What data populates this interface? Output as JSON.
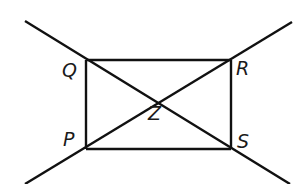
{
  "diagram": {
    "type": "geometry",
    "stroke_color": "#111111",
    "background": "#ffffff",
    "points": {
      "Q": {
        "label": "Q",
        "x": 86,
        "y": 60
      },
      "R": {
        "label": "R",
        "x": 231,
        "y": 60
      },
      "P": {
        "label": "P",
        "x": 86,
        "y": 149
      },
      "S": {
        "label": "S",
        "x": 231,
        "y": 149
      },
      "Z": {
        "label": "Z",
        "x": 158.5,
        "y": 104.5
      }
    },
    "segments": [
      {
        "name": "QR",
        "from": "Q",
        "to": "R"
      },
      {
        "name": "RS",
        "from": "R",
        "to": "S"
      },
      {
        "name": "SP",
        "from": "S",
        "to": "P"
      },
      {
        "name": "PQ",
        "from": "P",
        "to": "Q"
      }
    ],
    "lines": [
      {
        "name": "line-QS",
        "through": [
          "Q",
          "Z",
          "S"
        ],
        "x1": 25,
        "y1": 21,
        "x2": 290,
        "y2": 184
      },
      {
        "name": "line-PR",
        "through": [
          "P",
          "Z",
          "R"
        ],
        "x1": 25,
        "y1": 184,
        "x2": 292,
        "y2": 22
      }
    ],
    "labels": {
      "Q": "Q",
      "R": "R",
      "P": "P",
      "S": "S",
      "Z": "Z"
    }
  }
}
